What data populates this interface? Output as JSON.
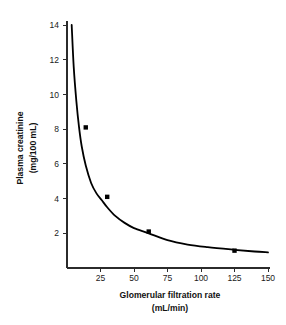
{
  "chart_data": {
    "type": "line",
    "title": "",
    "subtitle": "",
    "xlabel": "Glomerular filtration rate",
    "xlabel_units": "(mL/min)",
    "ylabel": "Plasma creatinine",
    "ylabel_units": "(mg/100 mL)",
    "xlim": [
      0,
      150
    ],
    "ylim": [
      0,
      14
    ],
    "xticks": [
      25,
      50,
      75,
      100,
      125,
      150
    ],
    "yticks": [
      2,
      4,
      6,
      8,
      10,
      12,
      14
    ],
    "grid": false,
    "legend": null,
    "series": [
      {
        "name": "Plasma creatinine vs GFR",
        "relationship": "inverse hyperbolic",
        "line_color": "#000000",
        "marker_color": "#000000",
        "x": [
          3.5,
          5,
          7,
          9,
          11,
          14,
          18,
          22,
          26,
          30,
          36,
          43,
          50,
          61,
          75,
          90,
          105,
          125,
          140,
          150
        ],
        "y": [
          14.0,
          11.6,
          9.6,
          8.1,
          7.0,
          5.9,
          4.9,
          4.3,
          3.9,
          3.5,
          3.0,
          2.6,
          2.3,
          2.0,
          1.6,
          1.35,
          1.2,
          1.05,
          0.95,
          0.9
        ],
        "data_points": [
          {
            "x": 14,
            "y": 8.1
          },
          {
            "x": 30,
            "y": 4.1
          },
          {
            "x": 61,
            "y": 2.1
          },
          {
            "x": 125,
            "y": 1.0
          }
        ]
      }
    ],
    "annotations": []
  },
  "colors": {
    "background": "#ffffff",
    "axis": "#2b2b2b",
    "curve": "#000000",
    "text": "#1a1a1a"
  }
}
